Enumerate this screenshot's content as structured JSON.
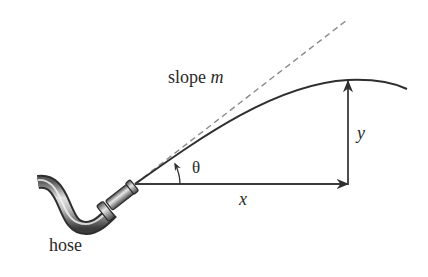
{
  "diagram": {
    "labels": {
      "slope_text": "slope",
      "slope_var": "m",
      "theta": "θ",
      "x": "x",
      "y": "y",
      "hose": "hose"
    },
    "elements": [
      {
        "id": "hose",
        "type": "illustration",
        "description": "curved garden hose with nozzle"
      },
      {
        "id": "tangent",
        "type": "dashed-line",
        "description": "tangent line at nozzle with slope m"
      },
      {
        "id": "trajectory",
        "type": "curve",
        "description": "parabolic water stream path"
      },
      {
        "id": "x-arrow",
        "type": "arrow",
        "description": "horizontal displacement x"
      },
      {
        "id": "y-arrow",
        "type": "arrow",
        "description": "vertical displacement y"
      },
      {
        "id": "theta-arc",
        "type": "arc-arrow",
        "description": "launch angle θ"
      }
    ],
    "colors": {
      "line": "#2f2f2f",
      "dashed": "#8a8a8a",
      "hose_dark": "#3a3a3a",
      "hose_light": "#d8d8d8",
      "text": "#2a2a2a"
    }
  }
}
